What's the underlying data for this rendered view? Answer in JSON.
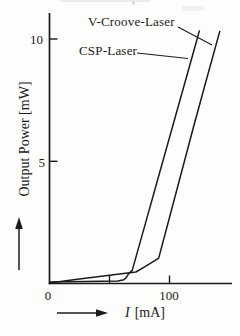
{
  "figure": {
    "ink_color": "#1b1b1b",
    "background": "#fdfdfc",
    "curve_labels": {
      "v_groove": "V-Croove-Laser",
      "csp": "CSP-Laser"
    }
  },
  "chart_data": {
    "type": "line",
    "title": "",
    "xlabel_var": "I",
    "xlabel_unit": "[mA]",
    "ylabel": "Output Power  [mW]",
    "xlim": [
      0,
      152
    ],
    "ylim": [
      0,
      11.2
    ],
    "grid": false,
    "legend_position": "inline-pointer-labels",
    "x_ticks": [
      {
        "value": 0,
        "label": "0"
      },
      {
        "value": 50,
        "label": ""
      },
      {
        "value": 100,
        "label": "100"
      }
    ],
    "y_ticks": [
      {
        "value": 5,
        "label": "5"
      },
      {
        "value": 10,
        "label": "10"
      }
    ],
    "series": [
      {
        "name": "CSP-Laser",
        "threshold_mA": 66,
        "points": [
          [
            0,
            0.06
          ],
          [
            30,
            0.08
          ],
          [
            57,
            0.1
          ],
          [
            62,
            0.15
          ],
          [
            64,
            0.25
          ],
          [
            66,
            0.4
          ],
          [
            69,
            0.55
          ],
          [
            80,
            2.47
          ],
          [
            90,
            4.22
          ],
          [
            100,
            5.97
          ],
          [
            110,
            7.72
          ],
          [
            120,
            9.47
          ],
          [
            125,
            10.35
          ]
        ]
      },
      {
        "name": "V-Croove-Laser",
        "threshold_mA": 90,
        "points": [
          [
            0,
            0.02
          ],
          [
            20,
            0.15
          ],
          [
            40,
            0.28
          ],
          [
            60,
            0.4
          ],
          [
            72,
            0.47
          ],
          [
            80,
            0.7
          ],
          [
            91,
            1.04
          ],
          [
            100,
            2.7
          ],
          [
            110,
            4.55
          ],
          [
            120,
            6.4
          ],
          [
            130,
            8.2
          ],
          [
            142,
            10.33
          ]
        ]
      }
    ]
  }
}
